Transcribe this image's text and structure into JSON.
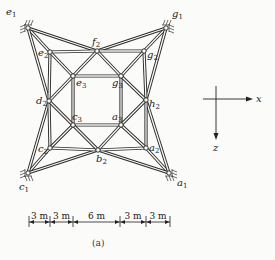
{
  "figure": {
    "caption": "(a)"
  },
  "nodes": [
    {
      "id": "e1",
      "base": "e",
      "sub": "1",
      "x": 28,
      "y": 28,
      "support": true,
      "lx": 6,
      "ly": 15
    },
    {
      "id": "g1",
      "base": "g",
      "sub": "1",
      "x": 166,
      "y": 28,
      "support": true,
      "lx": 172,
      "ly": 17
    },
    {
      "id": "c1",
      "base": "c",
      "sub": "1",
      "x": 28,
      "y": 173,
      "support": true,
      "lx": 19,
      "ly": 190
    },
    {
      "id": "a1",
      "base": "a",
      "sub": "1",
      "x": 169,
      "y": 173,
      "support": true,
      "lx": 177,
      "ly": 186
    },
    {
      "id": "e2",
      "base": "e",
      "sub": "2",
      "x": 50,
      "y": 52,
      "support": false,
      "lx": 38,
      "ly": 56
    },
    {
      "id": "f2",
      "base": "f",
      "sub": "2",
      "x": 97,
      "y": 51,
      "support": false,
      "lx": 92,
      "ly": 45
    },
    {
      "id": "g2",
      "base": "g",
      "sub": "2",
      "x": 144,
      "y": 51,
      "support": false,
      "lx": 147,
      "ly": 58
    },
    {
      "id": "d2",
      "base": "d",
      "sub": "2",
      "x": 49,
      "y": 101,
      "support": false,
      "lx": 36,
      "ly": 104
    },
    {
      "id": "h2",
      "base": "h",
      "sub": "2",
      "x": 146,
      "y": 100,
      "support": false,
      "lx": 149,
      "ly": 107
    },
    {
      "id": "c2",
      "base": "c",
      "sub": "2",
      "x": 50,
      "y": 148,
      "support": false,
      "lx": 38,
      "ly": 152
    },
    {
      "id": "b2",
      "base": "b",
      "sub": "2",
      "x": 98,
      "y": 150,
      "support": false,
      "lx": 96,
      "ly": 162
    },
    {
      "id": "a2",
      "base": "a",
      "sub": "2",
      "x": 146,
      "y": 148,
      "support": false,
      "lx": 149,
      "ly": 151
    },
    {
      "id": "e3",
      "base": "e",
      "sub": "3",
      "x": 73,
      "y": 76,
      "support": false,
      "lx": 76,
      "ly": 86
    },
    {
      "id": "g3",
      "base": "g",
      "sub": "3",
      "x": 121,
      "y": 76,
      "support": false,
      "lx": 112,
      "ly": 86
    },
    {
      "id": "c3",
      "base": "c",
      "sub": "3",
      "x": 73,
      "y": 125,
      "support": false,
      "lx": 72,
      "ly": 120
    },
    {
      "id": "a3",
      "base": "a",
      "sub": "3",
      "x": 121,
      "y": 125,
      "support": false,
      "lx": 112,
      "ly": 120
    }
  ],
  "members": [
    [
      "e1",
      "e2"
    ],
    [
      "e1",
      "f2"
    ],
    [
      "e1",
      "d2"
    ],
    [
      "g1",
      "g2"
    ],
    [
      "g1",
      "f2"
    ],
    [
      "g1",
      "h2"
    ],
    [
      "c1",
      "c2"
    ],
    [
      "c1",
      "d2"
    ],
    [
      "c1",
      "b2"
    ],
    [
      "a1",
      "a2"
    ],
    [
      "a1",
      "h2"
    ],
    [
      "a1",
      "b2"
    ],
    [
      "e2",
      "f2"
    ],
    [
      "f2",
      "g2"
    ],
    [
      "g2",
      "h2"
    ],
    [
      "h2",
      "a2"
    ],
    [
      "a2",
      "b2"
    ],
    [
      "b2",
      "c2"
    ],
    [
      "c2",
      "d2"
    ],
    [
      "d2",
      "e2"
    ],
    [
      "e3",
      "g3"
    ],
    [
      "g3",
      "a3"
    ],
    [
      "a3",
      "c3"
    ],
    [
      "c3",
      "e3"
    ],
    [
      "e2",
      "e3"
    ],
    [
      "g2",
      "g3"
    ],
    [
      "a2",
      "a3"
    ],
    [
      "c2",
      "c3"
    ],
    [
      "f2",
      "e3"
    ],
    [
      "f2",
      "g3"
    ],
    [
      "h2",
      "g3"
    ],
    [
      "h2",
      "a3"
    ],
    [
      "b2",
      "a3"
    ],
    [
      "b2",
      "c3"
    ],
    [
      "d2",
      "c3"
    ],
    [
      "d2",
      "e3"
    ]
  ],
  "axes": {
    "x_label": "x",
    "z_label": "z",
    "origin": [
      216,
      99
    ]
  },
  "dimensions": {
    "segments": [
      "3 m",
      "3 m",
      "6 m",
      "3 m",
      "3 m"
    ],
    "ticks": [
      29,
      50,
      73,
      120,
      146,
      170
    ],
    "y": 222
  }
}
